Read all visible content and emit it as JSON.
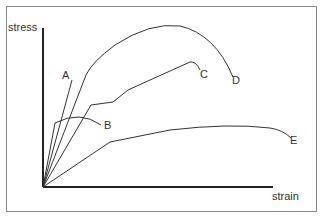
{
  "diagram": {
    "type": "stress-strain curves",
    "axes": {
      "y_label": "stress",
      "x_label": "strain"
    },
    "curves": [
      {
        "id": "A",
        "label": "A",
        "description": "steep straight line, brittle"
      },
      {
        "id": "B",
        "label": "B",
        "description": "low stress, short curve"
      },
      {
        "id": "C",
        "label": "C",
        "description": "yield kink then rising to ultimate, fracture"
      },
      {
        "id": "D",
        "label": "D",
        "description": "highest stress, large strain"
      },
      {
        "id": "E",
        "label": "E",
        "description": "low stiffness, largest strain"
      }
    ],
    "colors": {
      "line": "#333333",
      "axis": "#222222",
      "frame": "#8a8a8a"
    }
  }
}
